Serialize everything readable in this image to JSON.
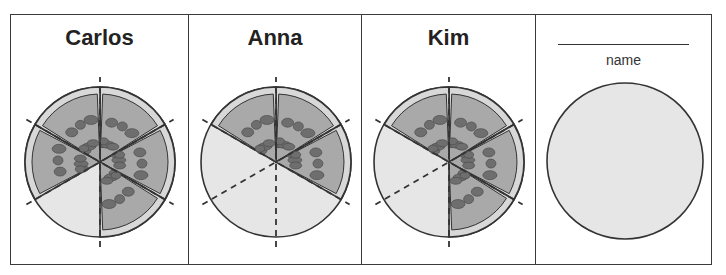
{
  "panels": [
    {
      "name": "Carlos",
      "slices_total": 6,
      "slices_remaining": 5,
      "missing": [
        3
      ]
    },
    {
      "name": "Anna",
      "slices_total": 6,
      "slices_remaining": 3,
      "missing": [
        2,
        3,
        4
      ]
    },
    {
      "name": "Kim",
      "slices_total": 6,
      "slices_remaining": 4,
      "missing": [
        3,
        4
      ]
    },
    {
      "name_placeholder_label": "name",
      "empty_circle": true
    }
  ],
  "colors": {
    "cheese": "#a9a9a9",
    "crust": "#d8d8d8",
    "pepperoni": "#6e6e6e",
    "empty": "#e6e6e6",
    "outline": "#333333"
  }
}
